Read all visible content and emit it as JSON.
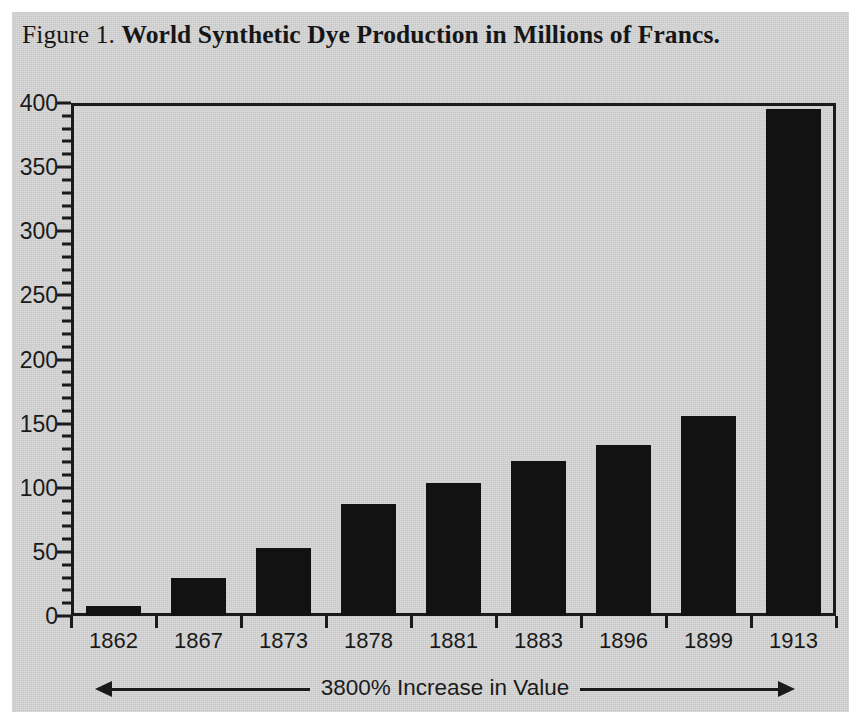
{
  "figure": {
    "number_label": "Figure 1.",
    "title": "World Synthetic Dye Production in Millions of Francs.",
    "annotation": "3800% Increase in Value"
  },
  "colors": {
    "paper_background": "#d6d6d6",
    "ink": "#1a1a1a",
    "bar_fill": "#121212"
  },
  "chart_data": {
    "type": "bar",
    "title": "World Synthetic Dye Production in Millions of Francs.",
    "xlabel": "",
    "ylabel": "",
    "categories": [
      "1862",
      "1867",
      "1873",
      "1878",
      "1881",
      "1883",
      "1896",
      "1899",
      "1913"
    ],
    "values": [
      8,
      30,
      53,
      87,
      104,
      121,
      133,
      156,
      395
    ],
    "ylim": [
      0,
      400
    ],
    "ytick_values": [
      0,
      50,
      100,
      150,
      200,
      250,
      300,
      350,
      400
    ],
    "ytick_labels": [
      "0",
      "50",
      "100",
      "150",
      "200",
      "250",
      "300",
      "350",
      "400"
    ],
    "minor_tick_step": 10,
    "grid": false,
    "legend": null,
    "annotations": [
      {
        "text": "3800% Increase in Value",
        "style": "double-headed-arrow",
        "position": "below-x-axis"
      }
    ]
  }
}
